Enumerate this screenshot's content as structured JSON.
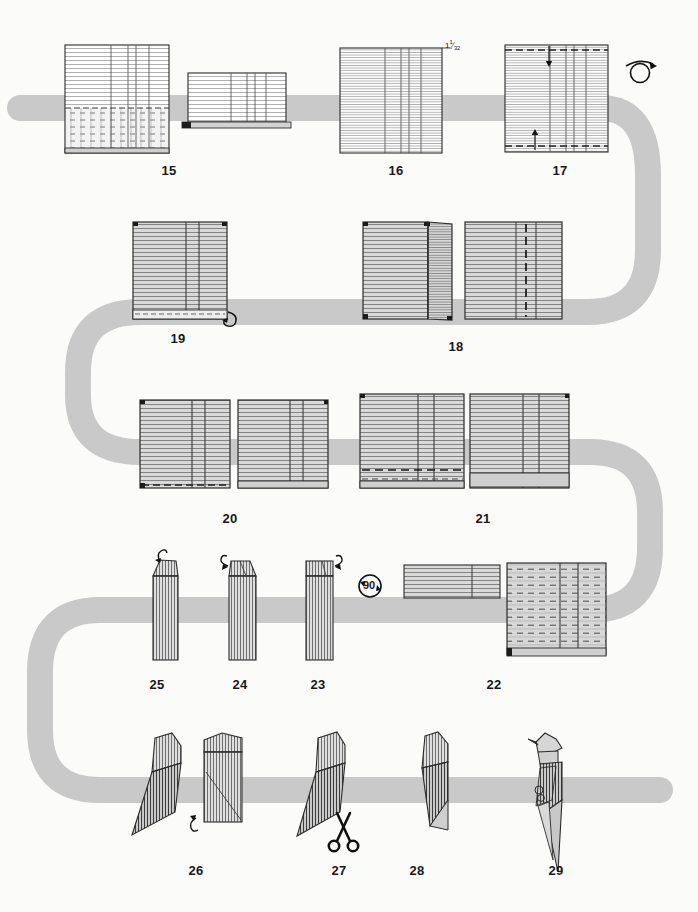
{
  "diagram": {
    "background_color": "#fbfbfa",
    "flow_ribbon_color": "#c9c9c9",
    "paper_line_color": "#555555",
    "paper_fill_light": "#ffffff",
    "paper_fill_gray": "#d8d8d8",
    "outline_color": "#2b2b2b"
  },
  "steps": [
    {
      "number": "15",
      "label_x": 169,
      "label_y": 163
    },
    {
      "number": "16",
      "label_x": 396,
      "label_y": 163
    },
    {
      "number": "17",
      "label_x": 560,
      "label_y": 163
    },
    {
      "number": "19",
      "label_x": 178,
      "label_y": 331
    },
    {
      "number": "18",
      "label_x": 456,
      "label_y": 339
    },
    {
      "number": "20",
      "label_x": 230,
      "label_y": 511
    },
    {
      "number": "21",
      "label_x": 483,
      "label_y": 511
    },
    {
      "number": "25",
      "label_x": 157,
      "label_y": 677
    },
    {
      "number": "24",
      "label_x": 240,
      "label_y": 677
    },
    {
      "number": "23",
      "label_x": 318,
      "label_y": 677
    },
    {
      "number": "22",
      "label_x": 494,
      "label_y": 677
    },
    {
      "number": "26",
      "label_x": 196,
      "label_y": 863
    },
    {
      "number": "27",
      "label_x": 339,
      "label_y": 863
    },
    {
      "number": "28",
      "label_x": 417,
      "label_y": 863
    },
    {
      "number": "29",
      "label_x": 556,
      "label_y": 863
    }
  ],
  "annotations": {
    "measurement": {
      "text_whole": "1",
      "text_numerator": "1",
      "text_denominator": "32",
      "x": 436,
      "y": 43
    },
    "rotate_degrees": {
      "text": "90",
      "x": 361,
      "y": 578
    }
  },
  "symbols": [
    {
      "name": "turn-over-loop-arrow",
      "x": 640,
      "y": 70
    },
    {
      "name": "pull-out-curl-arrow",
      "x": 224,
      "y": 316
    },
    {
      "name": "unfold-curl-arrow-left",
      "x": 225,
      "y": 571
    },
    {
      "name": "unfold-curl-arrow-right",
      "x": 337,
      "y": 572
    },
    {
      "name": "rotate-90-arrow",
      "x": 370,
      "y": 586
    },
    {
      "name": "pleat-curl-arrow",
      "x": 195,
      "y": 824
    },
    {
      "name": "scissors-cut",
      "x": 343,
      "y": 833
    }
  ]
}
